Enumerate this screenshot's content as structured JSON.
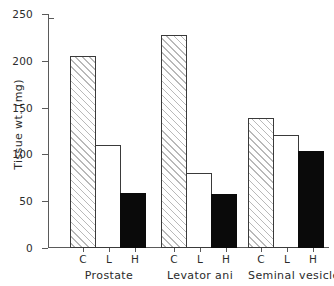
{
  "chart_data": {
    "type": "bar",
    "title": "",
    "xlabel": "",
    "ylabel": "Tissue wt. (mg)",
    "ylim": [
      0,
      250
    ],
    "yticks": [
      0,
      50,
      100,
      150,
      200,
      250
    ],
    "ytick_labels": [
      "0",
      "50",
      "100",
      "150",
      "200",
      "250"
    ],
    "grid": false,
    "legend": "none",
    "categories": [
      "Prostate",
      "Levator ani",
      "Seminal vesicle"
    ],
    "subcategories": [
      "C",
      "L",
      "H"
    ],
    "series": [
      {
        "name": "C",
        "fill": "hatched",
        "values": [
          205,
          228,
          139
        ]
      },
      {
        "name": "L",
        "fill": "open",
        "values": [
          110,
          80,
          121
        ]
      },
      {
        "name": "H",
        "fill": "solid",
        "values": [
          59,
          58,
          104
        ]
      }
    ],
    "groups": [
      {
        "label": "Prostate",
        "bars": [
          {
            "tick": "C",
            "value": 205,
            "fill": "hatched"
          },
          {
            "tick": "L",
            "value": 110,
            "fill": "open"
          },
          {
            "tick": "H",
            "value": 59,
            "fill": "solid"
          }
        ]
      },
      {
        "label": "Levator ani",
        "bars": [
          {
            "tick": "C",
            "value": 228,
            "fill": "hatched"
          },
          {
            "tick": "L",
            "value": 80,
            "fill": "open"
          },
          {
            "tick": "H",
            "value": 58,
            "fill": "solid"
          }
        ]
      },
      {
        "label": "Seminal vesicle",
        "bars": [
          {
            "tick": "C",
            "value": 139,
            "fill": "hatched"
          },
          {
            "tick": "L",
            "value": 121,
            "fill": "open"
          },
          {
            "tick": "H",
            "value": 104,
            "fill": "solid"
          }
        ]
      }
    ],
    "colors": {
      "axis": "#5a5a5a",
      "text": "#2b2b2b",
      "bar_outline": "#3a3a3a",
      "bar_solid": "#0a0a0a",
      "bar_open": "#ffffff",
      "bar_hatch": "#b9b9b9",
      "background": "#ffffff"
    }
  }
}
